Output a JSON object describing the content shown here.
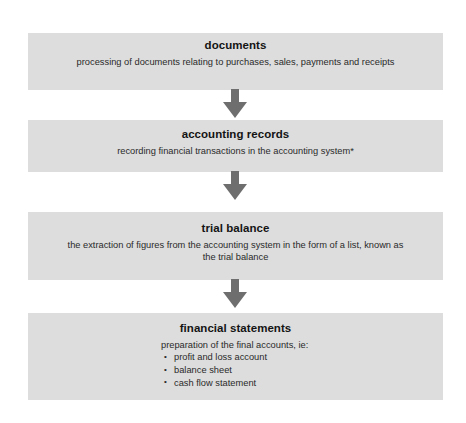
{
  "diagram": {
    "box_color": "#dddddd",
    "arrow_color": "#6e6e6e",
    "background": "#ffffff",
    "stages": [
      {
        "id": "documents",
        "title": "documents",
        "description": "processing of documents relating to purchases, sales, payments and receipts"
      },
      {
        "id": "accounting-records",
        "title": "accounting records",
        "description": "recording financial transactions in the accounting system*"
      },
      {
        "id": "trial-balance",
        "title": "trial balance",
        "description": "the extraction of figures from the accounting system in the form of a list, known as the trial balance"
      },
      {
        "id": "financial-statements",
        "title": "financial statements",
        "lead": "preparation of the final accounts, ie:",
        "items": [
          "profit and loss account",
          "balance sheet",
          "cash flow statement"
        ]
      }
    ],
    "arrows": [
      {
        "id": "arrow-documents-to-records",
        "direction": "down"
      },
      {
        "id": "arrow-records-to-trial",
        "direction": "down"
      },
      {
        "id": "arrow-trial-to-financial",
        "direction": "down"
      }
    ]
  }
}
